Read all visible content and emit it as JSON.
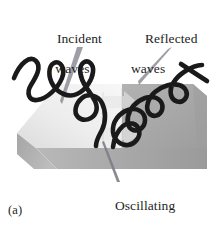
{
  "figure": {
    "panel_label": "(a)",
    "background_color": "#ffffff",
    "width": 222,
    "height": 227
  },
  "labels": {
    "incident": {
      "line1": "Incident",
      "line2": "waves"
    },
    "reflected": {
      "line1": "Reflected",
      "line2": "waves"
    },
    "oscillating": {
      "line1": "Oscillating",
      "line2": "electrons"
    }
  },
  "slab": {
    "top_left_face_color": "#ececed",
    "top_right_face_color": "#a9a9a9",
    "front_face_color": "#9b9b9b",
    "front_left_face_color": "#b4b4b4",
    "edge_color": "#cfcfcf"
  },
  "waves": {
    "stroke_color": "#1a1a1a",
    "stroke_width": 4.6,
    "incident_label_ref": "incident",
    "reflected_label_ref": "reflected"
  },
  "arrows": {
    "color": "#e4e4e4",
    "direction": "right",
    "count": 2
  },
  "leaders": {
    "color": "#6e6e79"
  }
}
